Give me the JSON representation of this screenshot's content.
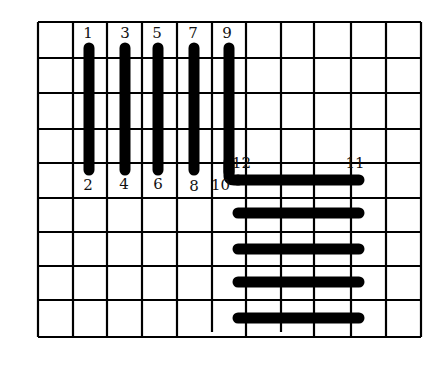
{
  "diagram": {
    "grid": {
      "x_lines": [
        38,
        73,
        107,
        142,
        177,
        212,
        246,
        281,
        314,
        351,
        386,
        421
      ],
      "y_lines": [
        22,
        58,
        93,
        129,
        163,
        198,
        232,
        266,
        300,
        337
      ],
      "short_x_lines": [
        212,
        281
      ],
      "short_bottom": 332,
      "line_color": "#000000",
      "line_width": 2.2
    },
    "bars": {
      "color": "#000000",
      "width": 11,
      "vertical": [
        {
          "x": 89,
          "y1": 48,
          "y2": 170,
          "top_label": "1",
          "bottom_label": "2"
        },
        {
          "x": 125,
          "y1": 48,
          "y2": 170,
          "top_label": "3",
          "bottom_label": "4"
        },
        {
          "x": 158,
          "y1": 48,
          "y2": 170,
          "top_label": "5",
          "bottom_label": "6"
        },
        {
          "x": 194,
          "y1": 48,
          "y2": 170,
          "top_label": "7",
          "bottom_label": "8"
        },
        {
          "x": 229,
          "y1": 48,
          "y2": 172,
          "top_label": "9",
          "bottom_label": "10"
        }
      ],
      "horizontal": [
        {
          "y": 180,
          "x1": 238,
          "x2": 359,
          "left_label": "12",
          "right_label": "11"
        },
        {
          "y": 213,
          "x1": 238,
          "x2": 359
        },
        {
          "y": 249,
          "x1": 238,
          "x2": 359
        },
        {
          "y": 282,
          "x1": 238,
          "x2": 359
        },
        {
          "y": 318,
          "x1": 238,
          "x2": 359
        }
      ]
    },
    "labels": [
      {
        "text": "1",
        "x": 88,
        "y": 38
      },
      {
        "text": "3",
        "x": 125,
        "y": 38
      },
      {
        "text": "5",
        "x": 157,
        "y": 38
      },
      {
        "text": "7",
        "x": 193,
        "y": 38
      },
      {
        "text": "9",
        "x": 227,
        "y": 38
      },
      {
        "text": "2",
        "x": 88,
        "y": 190
      },
      {
        "text": "4",
        "x": 124,
        "y": 189
      },
      {
        "text": "6",
        "x": 158,
        "y": 189
      },
      {
        "text": "8",
        "x": 194,
        "y": 191
      },
      {
        "text": "10",
        "x": 221,
        "y": 190
      },
      {
        "text": "12",
        "x": 242,
        "y": 168
      },
      {
        "text": "11",
        "x": 361,
        "y": 168
      }
    ]
  }
}
